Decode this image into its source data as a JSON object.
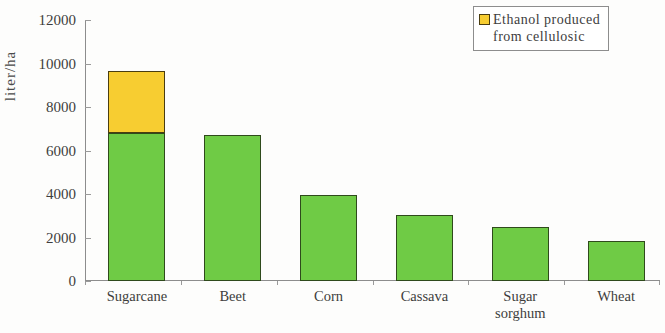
{
  "chart_data": {
    "type": "bar",
    "title": "",
    "subtitle": "",
    "xlabel": "",
    "ylabel": "liter/ha",
    "ylim": [
      0,
      12000
    ],
    "ytick_step": 2000,
    "yticks": [
      "12000",
      "10000",
      "8000",
      "6000",
      "4000",
      "2000",
      "0"
    ],
    "ytick_values": [
      12000,
      10000,
      8000,
      6000,
      4000,
      2000,
      0
    ],
    "grid": false,
    "stacked": true,
    "legend_position": "top-right",
    "categories": [
      "Sugarcane",
      "Beet",
      "Corn",
      "Cassava",
      "Sugar sorghum",
      "Wheat"
    ],
    "category_display": [
      "Sugarcane",
      "Beet",
      "Corn",
      "Cassava",
      "Sugar\nsorghum",
      "Wheat"
    ],
    "series": [
      {
        "name": "Ethanol produced from starch/sugar",
        "color": "#6fcb45",
        "in_legend": false,
        "values": [
          6800,
          6700,
          3950,
          3050,
          2480,
          1820
        ]
      },
      {
        "name": "Ethanol produced from cellulosic",
        "color": "#f7cd31",
        "in_legend": true,
        "values": [
          2850,
          0,
          0,
          0,
          0,
          0
        ]
      }
    ],
    "totals": [
      9650,
      6700,
      3950,
      3050,
      2480,
      1820
    ]
  },
  "legend": {
    "label": "Ethanol produced\nfrom cellulosic",
    "swatch_color": "#f7cd31"
  },
  "axis": {
    "y_title": "liter/ha"
  }
}
